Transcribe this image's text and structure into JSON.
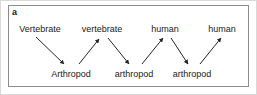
{
  "figure": {
    "panel_letter": "a",
    "background_color": "#ffffff",
    "panel_border_color": "#8c8c8c",
    "outer_border_color": "#d9d9d9",
    "text_color": "#1a1a1a",
    "arrow_color": "#262626"
  },
  "diagram": {
    "type": "zigzag-host-transfer",
    "top_row": [
      {
        "label": "Vertebrate",
        "x": 40
      },
      {
        "label": "vertebrate",
        "x": 102
      },
      {
        "label": "human",
        "x": 165
      },
      {
        "label": "human",
        "x": 222
      }
    ],
    "bottom_row": [
      {
        "label": "Arthropod",
        "x": 71
      },
      {
        "label": "arthropod",
        "x": 134
      },
      {
        "label": "arthropod",
        "x": 192
      }
    ],
    "arrows": [
      {
        "name": "vertebrate-to-arthropod-1",
        "from": "Vertebrate",
        "to": "Arthropod",
        "direction": "down-right"
      },
      {
        "name": "arthropod-to-vertebrate-1",
        "from": "Arthropod",
        "to": "vertebrate",
        "direction": "up-right"
      },
      {
        "name": "vertebrate-to-arthropod-2",
        "from": "vertebrate",
        "to": "arthropod",
        "direction": "down-right"
      },
      {
        "name": "arthropod-to-human-1",
        "from": "arthropod",
        "to": "human",
        "direction": "up-right"
      },
      {
        "name": "human-to-arthropod-1",
        "from": "human",
        "to": "arthropod",
        "direction": "down-right"
      },
      {
        "name": "arthropod-to-human-2",
        "from": "arthropod",
        "to": "human",
        "direction": "up-right"
      }
    ]
  }
}
